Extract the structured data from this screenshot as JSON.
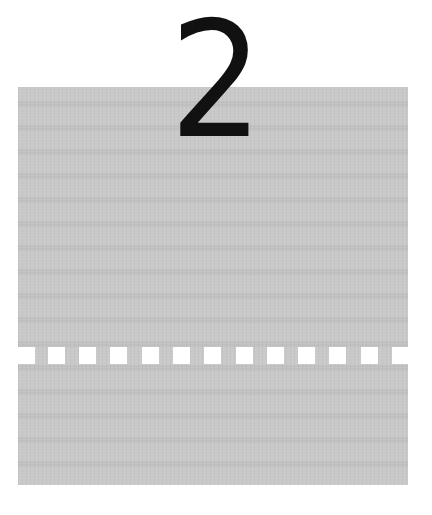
{
  "chapter": {
    "number": "2"
  },
  "panel": {
    "color": "#c9c9c9"
  },
  "perforation": {
    "hole_color": "#ffffff",
    "hole_count": 13,
    "hole_positions_x": [
      0,
      30,
      61,
      92,
      124,
      155,
      186,
      218,
      249,
      280,
      311,
      343,
      374
    ]
  }
}
